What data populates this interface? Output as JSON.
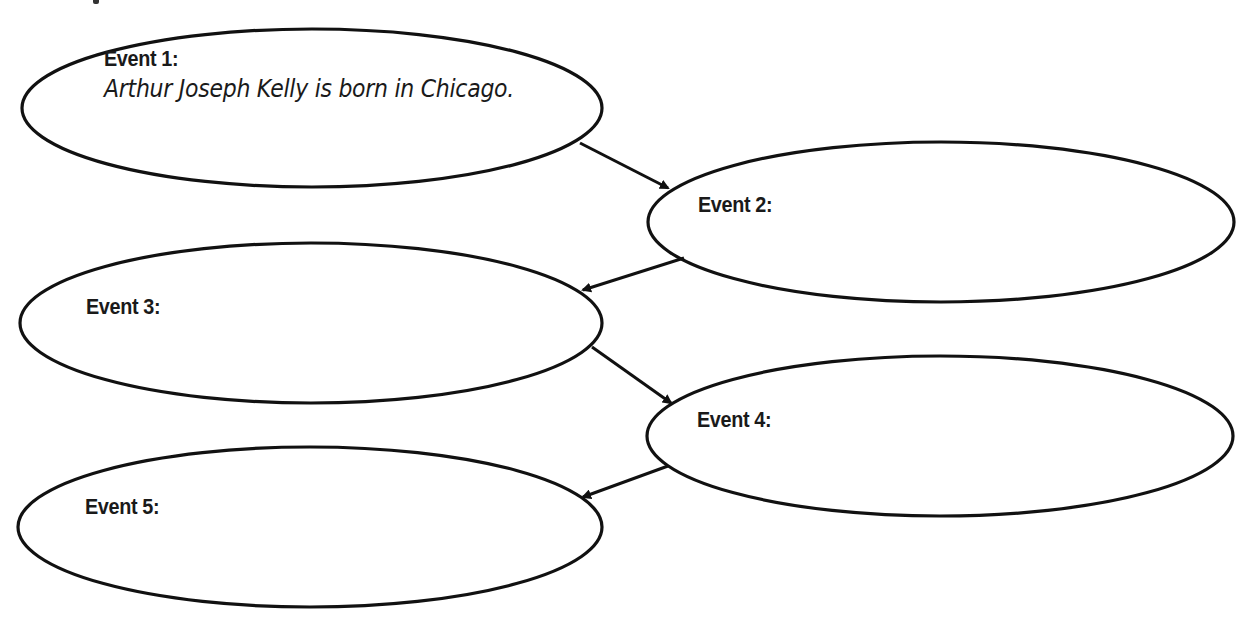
{
  "diagram": {
    "type": "sequence-of-events graphic organizer",
    "stroke_color": "#111111",
    "background_color": "#ffffff",
    "events": [
      {
        "id": 1,
        "label": "Event 1:",
        "answer": "Arthur Joseph Kelly is born in Chicago.",
        "ellipse": {
          "cx": 312,
          "cy": 108,
          "rx": 290,
          "ry": 79
        }
      },
      {
        "id": 2,
        "label": "Event 2:",
        "answer": "",
        "ellipse": {
          "cx": 941,
          "cy": 222,
          "rx": 293,
          "ry": 80
        }
      },
      {
        "id": 3,
        "label": "Event 3:",
        "answer": "",
        "ellipse": {
          "cx": 311,
          "cy": 323,
          "rx": 291,
          "ry": 80
        }
      },
      {
        "id": 4,
        "label": "Event 4:",
        "answer": "",
        "ellipse": {
          "cx": 940,
          "cy": 436,
          "rx": 293,
          "ry": 80
        }
      },
      {
        "id": 5,
        "label": "Event 5:",
        "answer": "",
        "ellipse": {
          "cx": 310,
          "cy": 527,
          "rx": 292,
          "ry": 80
        }
      }
    ],
    "arrows": [
      {
        "from": 1,
        "to": 2,
        "x1": 580,
        "y1": 143,
        "x2": 668,
        "y2": 188
      },
      {
        "from": 2,
        "to": 3,
        "x1": 684,
        "y1": 258,
        "x2": 583,
        "y2": 290
      },
      {
        "from": 3,
        "to": 4,
        "x1": 592,
        "y1": 347,
        "x2": 671,
        "y2": 403
      },
      {
        "from": 4,
        "to": 5,
        "x1": 668,
        "y1": 466,
        "x2": 583,
        "y2": 497
      }
    ]
  }
}
